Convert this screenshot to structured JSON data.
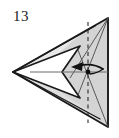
{
  "figure": {
    "kind": "origami-fold-diagram",
    "step_number": "13",
    "caption": "",
    "background_color": "#ffffff",
    "paper_fill": "#d4d4d4",
    "paper_fill_light": "#e3e3e3",
    "paper_fill_white": "#ffffff",
    "outline_color": "#1a1a1a",
    "crease_color": "#555555",
    "dashed_line_color": "#333333",
    "arrow_color": "#111111"
  },
  "geometry": {
    "left_point": {
      "x": 13,
      "y": 72
    },
    "top_right_point": {
      "x": 108,
      "y": 18
    },
    "bottom_right_point": {
      "x": 108,
      "y": 127
    },
    "right_edge": "vertical",
    "notch_tip": {
      "x": 62,
      "y": 72
    },
    "notch_top": {
      "x": 79,
      "y": 47
    },
    "notch_bottom": {
      "x": 79,
      "y": 97
    },
    "pivot_point": {
      "x": 88,
      "y": 72
    }
  },
  "elements": {
    "outer_triangle_label": "outer triangle outline",
    "inner_white_notch_label": "white V notch",
    "dashed_fold_line_label": "vertical dashed fold line",
    "horizontal_crease_label": "horizontal crease line",
    "diagonal_crease_label": "diagonal crease lines",
    "arrow_label": "curved fold arrow pointing left",
    "pivot_label": "fold pivot dot"
  },
  "colors": {
    "paper": "#d4d4d4",
    "paper_light": "#e6e6e6",
    "white": "#ffffff",
    "ink": "#1a1a1a",
    "crease": "#5a5a5a"
  }
}
